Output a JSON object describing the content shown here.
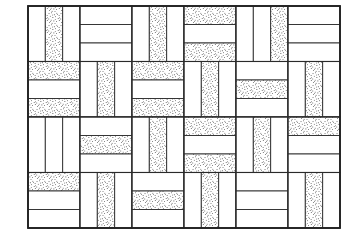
{
  "figure": {
    "title": "Basketweave parquet tiling pattern"
  },
  "canvas": {
    "width": 363,
    "height": 248,
    "background_color": "#ffffff"
  },
  "panel": {
    "label": "tiling-panel",
    "x": 28,
    "y": 6,
    "width": 312,
    "height": 222,
    "border_color": "#222222",
    "border_width": 1.8
  },
  "grid": {
    "columns": 6,
    "rows": 4,
    "block_width": 52,
    "block_height": 55.5,
    "strips_per_block": 3
  },
  "style": {
    "line_color": "#2a2a2a",
    "strip_line_width": 0.9,
    "block_line_width": 1.1,
    "plain_fill": "#ffffff",
    "stipple_dot_color": "#444444",
    "stipple_background": "#ffffff"
  },
  "legend": {
    "plain_strip_label": "plain strip",
    "stipple_strip_label": "stippled strip",
    "vertical_block_label": "vertical brick group",
    "horizontal_block_label": "horizontal brick group"
  },
  "chart_data": {
    "type": "diagram",
    "title": "Basketweave parquet tiling pattern",
    "xlabel": "",
    "ylabel": "",
    "grid": {
      "columns": 6,
      "rows": 4
    },
    "blocks": [
      {
        "row": 0,
        "col": 0,
        "orientation": "vertical",
        "stipple": [
          false,
          true,
          false
        ]
      },
      {
        "row": 0,
        "col": 1,
        "orientation": "horizontal",
        "stipple": [
          false,
          false,
          false
        ]
      },
      {
        "row": 0,
        "col": 2,
        "orientation": "vertical",
        "stipple": [
          false,
          true,
          false
        ]
      },
      {
        "row": 0,
        "col": 3,
        "orientation": "horizontal",
        "stipple": [
          true,
          false,
          true
        ]
      },
      {
        "row": 0,
        "col": 4,
        "orientation": "vertical",
        "stipple": [
          false,
          false,
          true
        ]
      },
      {
        "row": 0,
        "col": 5,
        "orientation": "horizontal",
        "stipple": [
          false,
          false,
          false
        ]
      },
      {
        "row": 1,
        "col": 0,
        "orientation": "horizontal",
        "stipple": [
          true,
          false,
          true
        ]
      },
      {
        "row": 1,
        "col": 1,
        "orientation": "vertical",
        "stipple": [
          false,
          true,
          false
        ]
      },
      {
        "row": 1,
        "col": 2,
        "orientation": "horizontal",
        "stipple": [
          true,
          false,
          true
        ]
      },
      {
        "row": 1,
        "col": 3,
        "orientation": "vertical",
        "stipple": [
          false,
          true,
          false
        ]
      },
      {
        "row": 1,
        "col": 4,
        "orientation": "horizontal",
        "stipple": [
          false,
          true,
          false
        ]
      },
      {
        "row": 1,
        "col": 5,
        "orientation": "vertical",
        "stipple": [
          false,
          true,
          false
        ]
      },
      {
        "row": 2,
        "col": 0,
        "orientation": "vertical",
        "stipple": [
          false,
          false,
          false
        ]
      },
      {
        "row": 2,
        "col": 1,
        "orientation": "horizontal",
        "stipple": [
          false,
          true,
          false
        ]
      },
      {
        "row": 2,
        "col": 2,
        "orientation": "vertical",
        "stipple": [
          false,
          true,
          false
        ]
      },
      {
        "row": 2,
        "col": 3,
        "orientation": "horizontal",
        "stipple": [
          true,
          false,
          true
        ]
      },
      {
        "row": 2,
        "col": 4,
        "orientation": "vertical",
        "stipple": [
          false,
          true,
          false
        ]
      },
      {
        "row": 2,
        "col": 5,
        "orientation": "horizontal",
        "stipple": [
          true,
          false,
          false
        ]
      },
      {
        "row": 3,
        "col": 0,
        "orientation": "horizontal",
        "stipple": [
          true,
          false,
          false
        ]
      },
      {
        "row": 3,
        "col": 1,
        "orientation": "vertical",
        "stipple": [
          false,
          true,
          false
        ]
      },
      {
        "row": 3,
        "col": 2,
        "orientation": "horizontal",
        "stipple": [
          false,
          true,
          false
        ]
      },
      {
        "row": 3,
        "col": 3,
        "orientation": "vertical",
        "stipple": [
          false,
          true,
          false
        ]
      },
      {
        "row": 3,
        "col": 4,
        "orientation": "horizontal",
        "stipple": [
          false,
          false,
          false
        ]
      },
      {
        "row": 3,
        "col": 5,
        "orientation": "vertical",
        "stipple": [
          false,
          true,
          false
        ]
      }
    ]
  }
}
